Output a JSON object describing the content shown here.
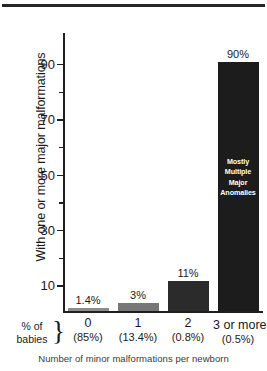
{
  "header": {
    "clipped_text": ""
  },
  "chart_data": {
    "type": "bar",
    "title": "",
    "xlabel": "Number of minor malformations per newborn",
    "ylabel": "With one or more major malformations",
    "categories": [
      "0",
      "1",
      "2",
      "3 or more"
    ],
    "category_subtitles": [
      "(85%)",
      "(13.4%)",
      "(0.8%)",
      "(0.5%)"
    ],
    "values": [
      1.4,
      3,
      11,
      90
    ],
    "value_labels": [
      "1.4%",
      "3%",
      "11%",
      "90%"
    ],
    "bar_colors": [
      "#8c8c8c",
      "#777777",
      "#2b2b2b",
      "#1c1c1c"
    ],
    "ylim": [
      0,
      90
    ],
    "y_major_ticks": [
      10,
      30,
      50,
      70,
      90
    ],
    "y_major_tick_labels": [
      "10",
      "30",
      "50",
      "70",
      "90"
    ],
    "y_minor_ticks": [
      20,
      40,
      60,
      80
    ],
    "grid": false,
    "legend": false,
    "annotations": [
      {
        "target_category": "3 or more",
        "lines": [
          "Mostly",
          "Multiple",
          "Major",
          "Anomalies"
        ],
        "color": "#ffffff"
      }
    ],
    "row_label": {
      "line1": "% of",
      "line2": "babies",
      "brace": "}"
    }
  }
}
